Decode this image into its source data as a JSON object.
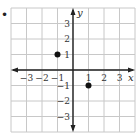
{
  "chart_data": {
    "type": "scatter",
    "title": "",
    "xlabel": "x",
    "ylabel": "y",
    "xlim": [
      -4,
      4
    ],
    "ylim": [
      -4,
      4
    ],
    "grid": true,
    "x_ticks": [
      -3,
      -2,
      -1,
      1,
      2,
      3
    ],
    "y_ticks": [
      3,
      2,
      1,
      -1,
      -2,
      -3
    ],
    "x_tick_labels": [
      "−3",
      "−2",
      "−1",
      "1",
      "2",
      "3"
    ],
    "y_tick_labels": [
      "3",
      "2",
      "1",
      "−1",
      "−2",
      "−3"
    ],
    "points": [
      {
        "x": -1,
        "y": 1
      },
      {
        "x": 1,
        "y": -1
      }
    ],
    "legend": []
  },
  "problem_marker": "•",
  "colors": {
    "grid": "#c8c8c8",
    "axis": "#222222",
    "point": "#111111"
  }
}
